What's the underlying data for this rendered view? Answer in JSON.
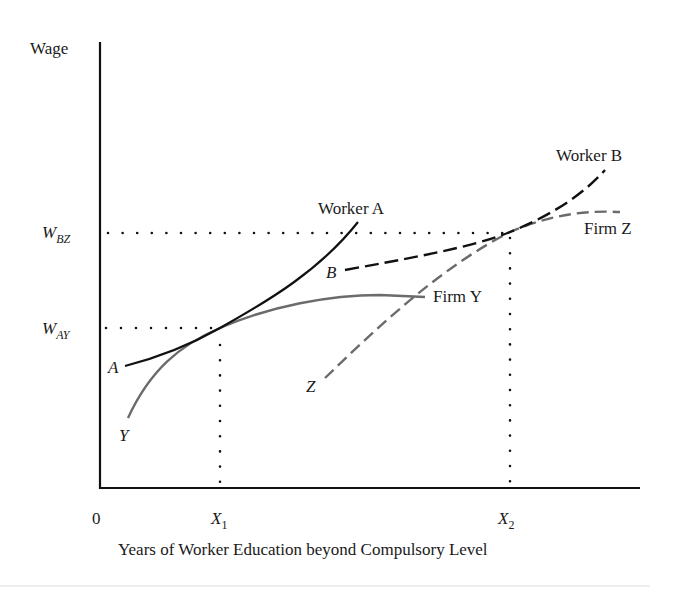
{
  "figure": {
    "y_axis_label": "Wage",
    "x_axis_label": "Years of Worker Education beyond Compulsory Level",
    "origin_label": "0",
    "y_ticks": [
      {
        "main": "W",
        "sub": "BZ"
      },
      {
        "main": "W",
        "sub": "AY"
      }
    ],
    "x_ticks": [
      {
        "main": "X",
        "sub": "1"
      },
      {
        "main": "X",
        "sub": "2"
      }
    ],
    "curves": {
      "worker_a": {
        "label": "Worker A",
        "start_label": "A",
        "style": "solid",
        "color": "#111111"
      },
      "firm_y": {
        "label": "Firm Y",
        "start_label": "Y",
        "style": "solid",
        "color": "#6b6b6b"
      },
      "worker_b": {
        "label": "Worker B",
        "start_label": "B",
        "style": "dashed",
        "color": "#111111"
      },
      "firm_z": {
        "label": "Firm Z",
        "start_label": "Z",
        "style": "dashed",
        "color": "#6b6b6b"
      }
    },
    "tangency_points": [
      {
        "name": "A-Y tangency",
        "x": "X1",
        "wage": "W_AY"
      },
      {
        "name": "B-Z tangency",
        "x": "X2",
        "wage": "W_BZ"
      }
    ]
  }
}
